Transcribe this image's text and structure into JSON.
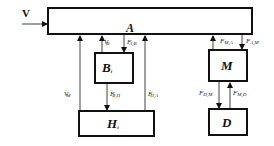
{
  "diagram": {
    "input": {
      "label": "V"
    },
    "blocks": {
      "A": {
        "label": "A"
      },
      "B": {
        "label": "B",
        "subscript": "i"
      },
      "H": {
        "label": "H",
        "subscript": "i"
      },
      "M": {
        "label": "M"
      },
      "D": {
        "label": "D"
      }
    },
    "edges": [
      {
        "from": "V",
        "to": "A",
        "label": ""
      },
      {
        "from": "H",
        "to": "A",
        "label": "V'_M",
        "base": "V",
        "sup": "'",
        "sub": "M"
      },
      {
        "from": "B",
        "to": "A",
        "label": "V'_B",
        "base": "V",
        "sup": "'",
        "sub": "B"
      },
      {
        "from": "A",
        "to": "B",
        "label": "F'_{A,B}",
        "base": "F",
        "sup": "'",
        "sub": "A,B"
      },
      {
        "from": "H",
        "to": "A",
        "label": "F'_{H,A}",
        "base": "F",
        "sup": "'",
        "sub": "H,A"
      },
      {
        "from": "B",
        "to": "H",
        "label": "F'_{B,H}",
        "base": "F",
        "sup": "'",
        "sub": "B,H"
      },
      {
        "from": "M",
        "to": "A",
        "label": "F_{M,A}",
        "base": "F",
        "sub": "M,A"
      },
      {
        "from": "A",
        "to": "M",
        "label": "F_{A,M}",
        "base": "F",
        "sub": "A,M"
      },
      {
        "from": "M",
        "to": "D",
        "label": "F_{D,M}",
        "base": "F",
        "sub": "D,M"
      },
      {
        "from": "D",
        "to": "M",
        "label": "F_{M,D}",
        "base": "F",
        "sub": "M,D"
      }
    ]
  }
}
